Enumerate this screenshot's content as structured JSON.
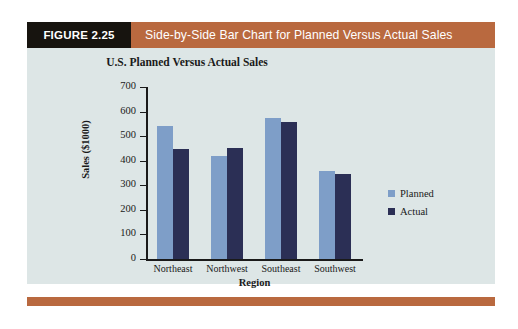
{
  "figure": {
    "number_label": "FIGURE 2.25",
    "caption": "Side-by-Side Bar Chart for Planned Versus Actual Sales",
    "header_bg": "#b9693f",
    "number_bg": "#17140f",
    "panel_bg": "#dde6e6",
    "rule_color": "#b9693f"
  },
  "chart_data": {
    "type": "bar",
    "title": "U.S. Planned Versus Actual Sales",
    "xlabel": "Region",
    "ylabel": "Sales ($1000)",
    "categories": [
      "Northeast",
      "Northwest",
      "Southeast",
      "Southwest"
    ],
    "series": [
      {
        "name": "Planned",
        "color": "#7e9ec8",
        "values": [
          540,
          420,
          575,
          360
        ]
      },
      {
        "name": "Actual",
        "color": "#2b2f55",
        "values": [
          447,
          450,
          557,
          345
        ]
      }
    ],
    "ylim": [
      0,
      700
    ],
    "yticks": [
      0,
      100,
      200,
      300,
      400,
      500,
      600,
      700
    ],
    "ytick_labels": [
      "0",
      "100",
      "200",
      "300",
      "400",
      "500",
      "600",
      "700"
    ],
    "grid": false,
    "legend_position": "right"
  }
}
